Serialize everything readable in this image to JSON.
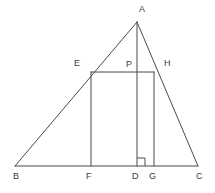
{
  "figure": {
    "canvas": {
      "width": 215,
      "height": 193
    },
    "style": {
      "stroke_color": "#4a4a52",
      "background_color": "#ffffff",
      "stroke_width": 1,
      "label_color": "#3d3d46",
      "label_font_size": 9
    },
    "points": {
      "A": {
        "label": "A",
        "x": 137,
        "y": 22,
        "label_x": 139,
        "label_y": 5
      },
      "B": {
        "label": "B",
        "x": 15,
        "y": 166,
        "label_x": 13,
        "label_y": 172
      },
      "C": {
        "label": "C",
        "x": 198,
        "y": 166,
        "label_x": 196,
        "label_y": 172
      },
      "D": {
        "label": "D",
        "x": 137,
        "y": 166,
        "label_x": 132,
        "label_y": 172
      },
      "E": {
        "label": "E",
        "x": 91,
        "y": 72,
        "label_x": 74,
        "label_y": 59
      },
      "F": {
        "label": "F",
        "x": 91,
        "y": 166,
        "label_x": 86,
        "label_y": 172
      },
      "G": {
        "label": "G",
        "x": 154,
        "y": 166,
        "label_x": 149,
        "label_y": 172
      },
      "H": {
        "label": "H",
        "x": 154,
        "y": 72,
        "label_x": 164,
        "label_y": 59
      },
      "P": {
        "label": "P",
        "x": 137,
        "y": 72,
        "label_x": 126,
        "label_y": 60
      }
    },
    "segments": [
      {
        "name": "side-AB",
        "from": "A",
        "to": "B"
      },
      {
        "name": "side-AC",
        "from": "A",
        "to": "C"
      },
      {
        "name": "base-BC",
        "from": "B",
        "to": "C"
      },
      {
        "name": "altitude-AD",
        "from": "A",
        "to": "D"
      },
      {
        "name": "rectangle-top-EH",
        "from": "E",
        "to": "H"
      },
      {
        "name": "rectangle-left-EF",
        "from": "E",
        "to": "F"
      },
      {
        "name": "rectangle-right-HG",
        "from": "H",
        "to": "G"
      }
    ],
    "right_angle_marker": {
      "name": "right-angle-at-D",
      "vertex": "D",
      "size": 8,
      "x": 137,
      "y": 158,
      "width": 8,
      "height": 8
    }
  }
}
